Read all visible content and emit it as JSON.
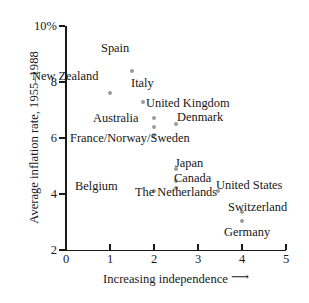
{
  "chart_data": {
    "type": "scatter",
    "title": "",
    "subtitle": "",
    "xlabel": "Increasing independence",
    "xlabel_arrow": "⟶",
    "ylabel": "Average inflation rate, 1955–1988",
    "xlim": [
      0,
      5
    ],
    "ylim": [
      2,
      10
    ],
    "xticks": [
      "0",
      "1",
      "2",
      "3",
      "4",
      "5"
    ],
    "xtick_values": [
      0,
      1,
      2,
      3,
      4,
      5
    ],
    "yticks": [
      "2",
      "4",
      "6",
      "8",
      "10%"
    ],
    "ytick_values": [
      2,
      4,
      6,
      8,
      10
    ],
    "grid": false,
    "legend": "none",
    "point_color": "#9b9b9b",
    "axis_color": "#1a1a1a",
    "points": [
      {
        "label": "Spain",
        "x": 1.5,
        "y": 8.4,
        "lx": 101,
        "ly": 42,
        "align": "left"
      },
      {
        "label": "New Zealand",
        "x": 1.0,
        "y": 7.6,
        "lx": 32,
        "ly": 70,
        "align": "left"
      },
      {
        "label": "Italy",
        "x": 1.75,
        "y": 7.3,
        "lx": 131,
        "ly": 77,
        "align": "left"
      },
      {
        "label": "United Kingdom",
        "x": 2.0,
        "y": 6.7,
        "lx": 146,
        "ly": 97,
        "align": "left"
      },
      {
        "label": "Australia",
        "x": 2.0,
        "y": 6.4,
        "lx": 93,
        "ly": 112,
        "align": "left"
      },
      {
        "label": "Denmark",
        "x": 2.5,
        "y": 6.5,
        "lx": 177,
        "ly": 111,
        "align": "left"
      },
      {
        "label": "France/Norway/Sweden",
        "x": 2.0,
        "y": 6.1,
        "lx": 70,
        "ly": 132,
        "align": "left"
      },
      {
        "label": "Japan",
        "x": 2.5,
        "y": 4.9,
        "lx": 175,
        "ly": 157,
        "align": "left"
      },
      {
        "label": "Canada",
        "x": 2.5,
        "y": 4.45,
        "lx": 174,
        "ly": 172,
        "align": "left"
      },
      {
        "label": "Belgium",
        "x": 2.0,
        "y": 4.1,
        "lx": 75,
        "ly": 180,
        "align": "left"
      },
      {
        "label": "United States",
        "x": 3.45,
        "y": 4.1,
        "lx": 216,
        "ly": 179,
        "align": "left"
      },
      {
        "label": "The Netherlands",
        "x": 2.5,
        "y": 4.2,
        "lx": 131,
        "ly": 186,
        "align": "center",
        "multiline": true,
        "lw": 90
      },
      {
        "label": "Switzerland",
        "x": 4.0,
        "y": 3.35,
        "lx": 228,
        "ly": 201,
        "align": "left"
      },
      {
        "label": "Germany",
        "x": 4.0,
        "y": 3.05,
        "lx": 224,
        "ly": 226,
        "align": "left"
      }
    ]
  }
}
